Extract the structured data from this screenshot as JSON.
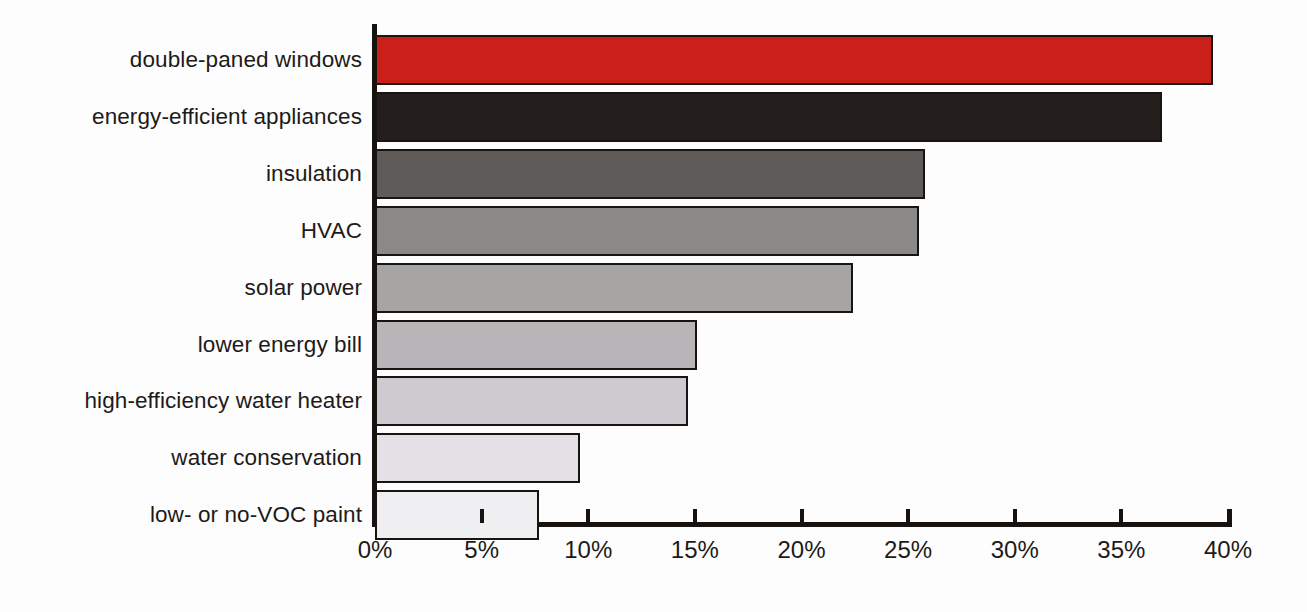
{
  "chart_data": {
    "type": "bar",
    "orientation": "horizontal",
    "title": "",
    "subtitle": "",
    "xlabel": "",
    "ylabel": "",
    "xlim": [
      0,
      40
    ],
    "xtick_values": [
      0,
      5,
      10,
      15,
      20,
      25,
      30,
      35,
      40
    ],
    "xtick_labels": [
      "0%",
      "5%",
      "10%",
      "15%",
      "20%",
      "25%",
      "30%",
      "35%",
      "40%"
    ],
    "grid": false,
    "legend": "none",
    "value_suffix": "%",
    "categories": [
      "double-paned windows",
      "energy-efficient appliances",
      "insulation",
      "HVAC",
      "solar power",
      "lower energy bill",
      "high-efficiency water heater",
      "water conservation",
      "low- or no-VOC paint"
    ],
    "values": [
      39.3,
      36.9,
      25.8,
      25.5,
      22.4,
      15.1,
      14.7,
      9.6,
      7.7
    ],
    "bar_colors": [
      "#c9201a",
      "#241f1d",
      "#5f5b59",
      "#8b8987",
      "#a7a5a3",
      "#b7b5b7",
      "#cdcbcf",
      "#e3e1e5",
      "#efeff1"
    ],
    "bar_border_color": "#171411",
    "axis_color": "#16120f",
    "text_color": "#1d1a18",
    "background_color": "#fdfdfd"
  }
}
